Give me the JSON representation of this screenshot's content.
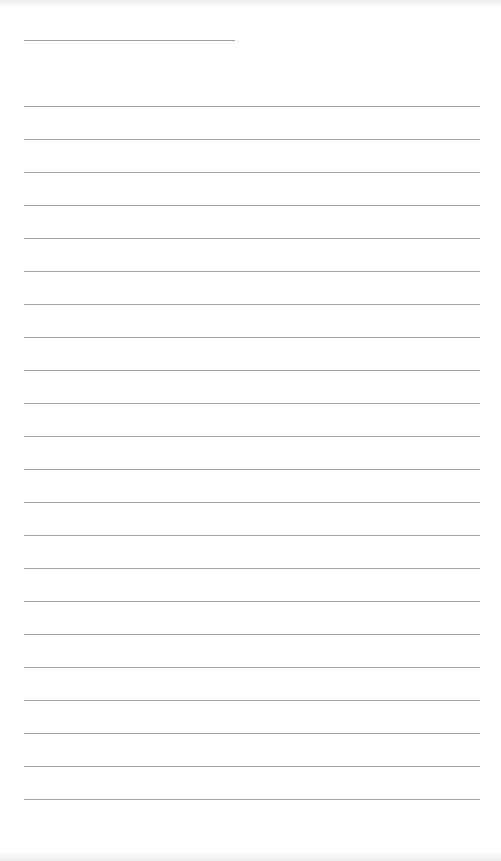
{
  "page": {
    "type": "lined-paper",
    "width": 501,
    "height": 861,
    "background_color": "#ffffff",
    "line_color": "#a3a3a3"
  },
  "title_line": {
    "x": 24,
    "y": 40,
    "width": 211
  },
  "ruled_lines": {
    "x": 24,
    "width": 456,
    "first_y": 106,
    "spacing": 33,
    "count": 22
  }
}
